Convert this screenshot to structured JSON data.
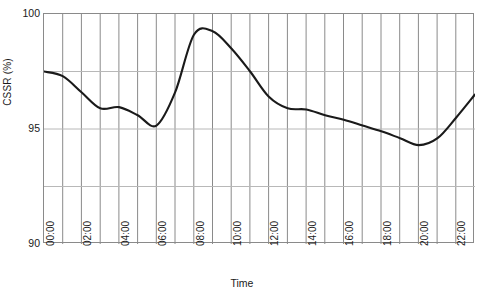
{
  "chart_data": {
    "type": "line",
    "title": "",
    "xlabel": "Time",
    "ylabel": "CSSR (%)",
    "ylim": [
      90,
      100
    ],
    "y_ticks": [
      90,
      95,
      100
    ],
    "y_tick_labels": [
      "90",
      "95",
      "100"
    ],
    "xlim": [
      "00:00",
      "23:00"
    ],
    "grid": "both",
    "legend": "none",
    "x_tick_labels": [
      "00:00",
      "02:00",
      "04:00",
      "06:00",
      "08:00",
      "10:00",
      "12:00",
      "14:00",
      "16:00",
      "18:00",
      "20:00",
      "22:00"
    ],
    "x": [
      "00:00",
      "01:00",
      "02:00",
      "03:00",
      "04:00",
      "05:00",
      "06:00",
      "07:00",
      "08:00",
      "09:00",
      "10:00",
      "11:00",
      "12:00",
      "13:00",
      "14:00",
      "15:00",
      "16:00",
      "17:00",
      "18:00",
      "19:00",
      "20:00",
      "21:00",
      "22:00",
      "23:00"
    ],
    "series": [
      {
        "name": "CSSR",
        "color": "#1a1a1a",
        "values": [
          97.5,
          97.3,
          96.6,
          95.9,
          95.95,
          95.6,
          95.15,
          96.6,
          99.1,
          99.25,
          98.5,
          97.5,
          96.4,
          95.9,
          95.85,
          95.6,
          95.4,
          95.15,
          94.9,
          94.6,
          94.3,
          94.6,
          95.5,
          96.5
        ]
      }
    ]
  },
  "axes": {
    "y_title": "CSSR (%)",
    "x_title": "Time"
  }
}
